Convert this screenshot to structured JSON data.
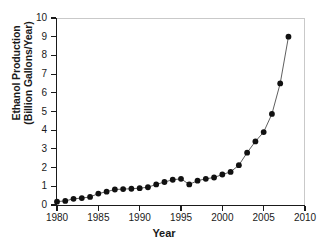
{
  "chart_data": {
    "type": "scatter",
    "title": "",
    "xlabel": "Year",
    "ylabel": "Ethanol Production (Billion Gallons/Year)",
    "ylabel_lines": [
      "Ethanol Production",
      "(Billion Gallons/Year)"
    ],
    "xlim": [
      1980,
      2010
    ],
    "ylim": [
      0,
      10
    ],
    "xticks": [
      1980,
      1985,
      1990,
      1995,
      2000,
      2005,
      2010
    ],
    "xtick_labels": [
      "1980",
      "1985",
      "1990",
      "1995",
      "2000",
      "2005",
      "2010"
    ],
    "yticks": [
      0,
      1,
      2,
      3,
      4,
      5,
      6,
      7,
      8,
      9,
      10
    ],
    "ytick_labels": [
      "0",
      "1",
      "2",
      "3",
      "4",
      "5",
      "6",
      "7",
      "8",
      "9",
      "10"
    ],
    "grid": false,
    "legend": null,
    "marker_style": "filled-circle",
    "marker_color": "#111111",
    "line_color": "#4d4d4d",
    "x": [
      1980,
      1981,
      1982,
      1983,
      1984,
      1985,
      1986,
      1987,
      1988,
      1989,
      1990,
      1991,
      1992,
      1993,
      1994,
      1995,
      1996,
      1997,
      1998,
      1999,
      2000,
      2001,
      2002,
      2003,
      2004,
      2005,
      2006,
      2007,
      2008
    ],
    "values": [
      0.18,
      0.22,
      0.33,
      0.37,
      0.43,
      0.61,
      0.71,
      0.83,
      0.85,
      0.87,
      0.9,
      0.95,
      1.1,
      1.23,
      1.35,
      1.4,
      1.1,
      1.3,
      1.4,
      1.47,
      1.63,
      1.77,
      2.13,
      2.8,
      3.4,
      3.9,
      4.87,
      6.5,
      9.0
    ],
    "series": [
      {
        "name": "Ethanol Production",
        "values": [
          0.18,
          0.22,
          0.33,
          0.37,
          0.43,
          0.61,
          0.71,
          0.83,
          0.85,
          0.87,
          0.9,
          0.95,
          1.1,
          1.23,
          1.35,
          1.4,
          1.1,
          1.3,
          1.4,
          1.47,
          1.63,
          1.77,
          2.13,
          2.8,
          3.4,
          3.9,
          4.87,
          6.5,
          9.0
        ]
      }
    ]
  }
}
